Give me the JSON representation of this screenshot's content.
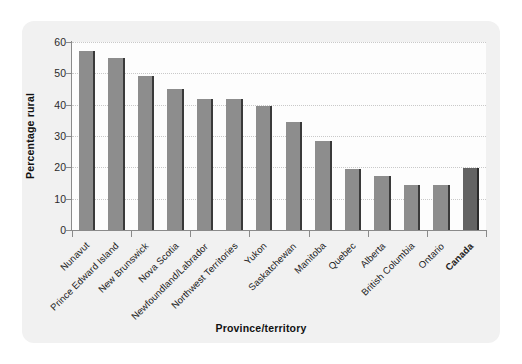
{
  "chart_data": {
    "type": "bar",
    "title": "",
    "xlabel": "Province/territory",
    "ylabel": "Percentage rural",
    "ylim": [
      0,
      60
    ],
    "ytick_step": 10,
    "yticks": [
      "0",
      "10",
      "20",
      "30",
      "40",
      "50",
      "60"
    ],
    "grid": true,
    "legend": "none",
    "categories": [
      "Nunavut",
      "Prince Edward Island",
      "New Brunswick",
      "Nova Scotia",
      "Newfoundland/Labrador",
      "Northwest Territories",
      "Yukon",
      "Saskatchewan",
      "Manitoba",
      "Quebec",
      "Alberta",
      "British Columbia",
      "Ontario",
      "Canada"
    ],
    "values": [
      57.0,
      55.0,
      49.0,
      45.0,
      41.7,
      41.7,
      39.6,
      34.5,
      28.5,
      19.5,
      17.3,
      14.3,
      14.3,
      19.7
    ],
    "highlight_category": "Canada",
    "bar_color": "#8d8d8d",
    "highlight_bar_color": "#636363",
    "bar_edge_color": "#3a3a3a",
    "panel_color": "#f1f1f1",
    "plot_background_color": "#fdfdfd",
    "gridline_color": "#c9c9c9",
    "axis_color": "#8a8a8a"
  }
}
